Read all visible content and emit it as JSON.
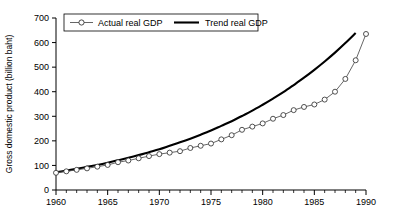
{
  "chart_data": {
    "type": "line",
    "title": "",
    "xlabel": "",
    "ylabel": "Gross domestic product (billion baht)",
    "xlim": [
      1960,
      1990
    ],
    "ylim": [
      0,
      700
    ],
    "grid": false,
    "legend_position": "top-left",
    "x_major_ticks": [
      1960,
      1965,
      1970,
      1975,
      1980,
      1985,
      1990
    ],
    "x_major_tick_labels": [
      "1960",
      "1965",
      "1970",
      "1975",
      "1980",
      "1985",
      "1990"
    ],
    "x_minor_tick_step": 1,
    "y_ticks": [
      0,
      100,
      200,
      300,
      400,
      500,
      600,
      700
    ],
    "y_tick_labels": [
      "0",
      "100",
      "200",
      "300",
      "400",
      "500",
      "600",
      "700"
    ],
    "x": [
      1960,
      1961,
      1962,
      1963,
      1964,
      1965,
      1966,
      1967,
      1968,
      1969,
      1970,
      1971,
      1972,
      1973,
      1974,
      1975,
      1976,
      1977,
      1978,
      1979,
      1980,
      1981,
      1982,
      1983,
      1984,
      1985,
      1986,
      1987,
      1988,
      1989,
      1990
    ],
    "series": [
      {
        "name": "Actual real GDP",
        "marker": "open-circle",
        "line_style": "thin-solid",
        "color": "#444444",
        "values": [
          70,
          76,
          82,
          88,
          95,
          102,
          113,
          120,
          129,
          138,
          146,
          152,
          158,
          171,
          180,
          189,
          206,
          223,
          245,
          258,
          271,
          290,
          305,
          325,
          338,
          348,
          368,
          400,
          452,
          528,
          635
        ]
      },
      {
        "name": "Trend real GDP",
        "marker": "none",
        "line_style": "thick-solid",
        "color": "#000000",
        "values": [
          72,
          79,
          86,
          94,
          102,
          111,
          121,
          131,
          142,
          154,
          166,
          180,
          194,
          209,
          225,
          242,
          261,
          280,
          301,
          323,
          347,
          372,
          398,
          427,
          457,
          489,
          523,
          559,
          598,
          639,
          600
        ]
      }
    ],
    "annotations": []
  },
  "legend": {
    "entries": [
      {
        "label": "Actual real GDP"
      },
      {
        "label": "Trend real GDP"
      }
    ]
  },
  "axes": {
    "y_title": "Gross domestic product (billion baht)"
  }
}
